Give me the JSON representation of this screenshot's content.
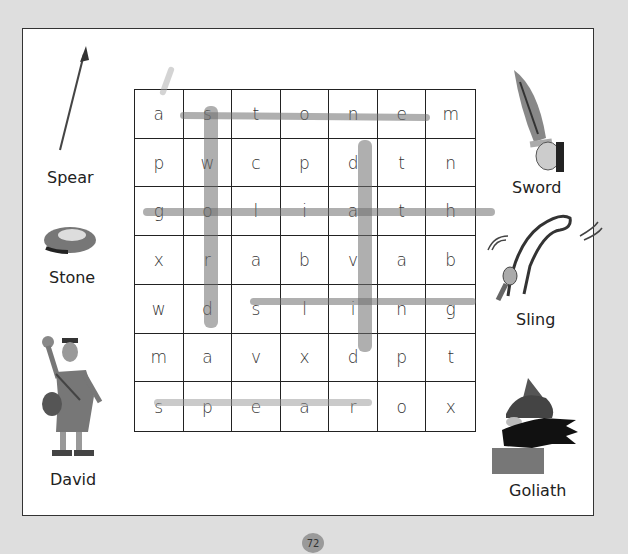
{
  "puzzle": {
    "grid": [
      [
        "a",
        "s",
        "t",
        "o",
        "n",
        "e",
        "m"
      ],
      [
        "p",
        "w",
        "c",
        "p",
        "d",
        "t",
        "n"
      ],
      [
        "g",
        "o",
        "l",
        "i",
        "a",
        "t",
        "h"
      ],
      [
        "x",
        "r",
        "a",
        "b",
        "v",
        "a",
        "b"
      ],
      [
        "w",
        "d",
        "s",
        "l",
        "i",
        "n",
        "g"
      ],
      [
        "m",
        "a",
        "v",
        "x",
        "d",
        "p",
        "t"
      ],
      [
        "s",
        "p",
        "e",
        "a",
        "r",
        "o",
        "x"
      ]
    ],
    "found_words": [
      "stone",
      "sword",
      "goliath",
      "david",
      "sling",
      "spear"
    ]
  },
  "pictures": {
    "spear": {
      "label": "Spear",
      "icon": "spear-icon"
    },
    "stone": {
      "label": "Stone",
      "icon": "stone-icon"
    },
    "david": {
      "label": "David",
      "icon": "david-icon"
    },
    "sword": {
      "label": "Sword",
      "icon": "sword-icon"
    },
    "sling": {
      "label": "Sling",
      "icon": "sling-icon"
    },
    "goliath": {
      "label": "Goliath",
      "icon": "goliath-icon"
    }
  },
  "page_number": "72",
  "colors": {
    "background": "#dedede",
    "page": "#ffffff",
    "highlight": "#8a8a8a"
  }
}
